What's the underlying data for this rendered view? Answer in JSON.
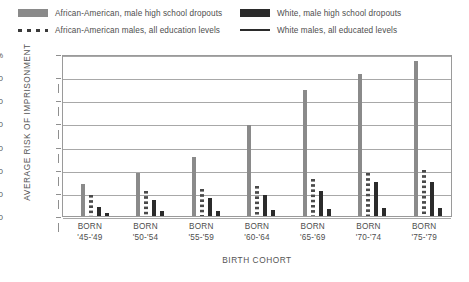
{
  "legend": {
    "entries": [
      {
        "label": "African-American, male high school dropouts",
        "style": "solid-gray",
        "color": "#8a8a8a"
      },
      {
        "label": "White, male high school dropouts",
        "style": "solid-black",
        "color": "#2b2b2b"
      },
      {
        "label": "African-American males, all education levels",
        "style": "dotted",
        "color": "#3a3a3a"
      },
      {
        "label": "White males, all educated levels",
        "style": "line",
        "color": "#2b2b2b"
      }
    ]
  },
  "axes": {
    "ylabel": "AVERAGE RISK OF IMPRISONMENT",
    "xlabel": "BIRTH COHORT",
    "yticks": [
      "70%",
      "60",
      "50",
      "40",
      "30",
      "20",
      "10",
      "0"
    ]
  },
  "chart_data": {
    "type": "bar",
    "title": "",
    "xlabel": "BIRTH COHORT",
    "ylabel": "AVERAGE RISK OF IMPRISONMENT",
    "ylim": [
      0,
      70
    ],
    "ytick_values": [
      0,
      10,
      20,
      30,
      40,
      50,
      60,
      70
    ],
    "grid": true,
    "legend_position": "top",
    "categories": [
      "BORN\n'45-'49",
      "BORN\n'50-'54",
      "BORN\n'55-'59",
      "BORN\n'60-'64",
      "BORN\n'65-'69",
      "BORN\n'70-'74",
      "BORN\n'75-'79"
    ],
    "category_lines": [
      [
        "BORN",
        "'45-'49"
      ],
      [
        "BORN",
        "'50-'54"
      ],
      [
        "BORN",
        "'55-'59"
      ],
      [
        "BORN",
        "'60-'64"
      ],
      [
        "BORN",
        "'65-'69"
      ],
      [
        "BORN",
        "'70-'74"
      ],
      [
        "BORN",
        "'75-'79"
      ]
    ],
    "series": [
      {
        "name": "African-American, male high school dropouts",
        "color": "#8a8a8a",
        "values": [
          14,
          19,
          26,
          40,
          55,
          62,
          68
        ]
      },
      {
        "name": "African-American males, all education levels",
        "color": "#3a3a3a",
        "values": [
          9,
          11,
          12,
          13,
          16,
          19,
          20
        ]
      },
      {
        "name": "White, male high school dropouts",
        "color": "#2b2b2b",
        "values": [
          4,
          7,
          8,
          9,
          11,
          15,
          15
        ]
      },
      {
        "name": "White males, all educated levels",
        "color": "#2b2b2b",
        "values": [
          1.5,
          2,
          2,
          2.5,
          3,
          3.5,
          3.5
        ]
      }
    ]
  }
}
